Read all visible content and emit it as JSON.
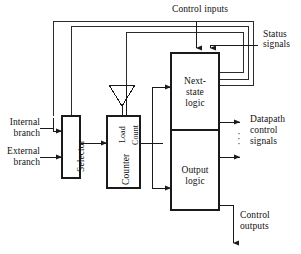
{
  "diagram": {
    "blocks": [
      {
        "id": "selector",
        "label": "Selector",
        "orientation": "vertical"
      },
      {
        "id": "counter",
        "label": "Counter",
        "orientation": "vertical"
      },
      {
        "id": "next_state",
        "label_line1": "Next-",
        "label_line2": "state",
        "label_line3": "logic"
      },
      {
        "id": "output",
        "label_line1": "Output",
        "label_line2": "logic"
      }
    ],
    "counter_pins": {
      "load": "Load",
      "count": "Count"
    },
    "labels": {
      "control_inputs": "Control inputs",
      "status_signals_line1": "Status",
      "status_signals_line2": "signals",
      "internal_branch_line1": "Internal",
      "internal_branch_line2": "branch",
      "external_branch_line1": "External",
      "external_branch_line2": "branch",
      "datapath_line1": "Datapath",
      "datapath_line2": "control",
      "datapath_line3": "signals",
      "control_outputs_line1": "Control",
      "control_outputs_line2": "outputs",
      "ellipsis": "·\n·\n·"
    },
    "colors": {
      "stroke": "#1a1a1a",
      "line": "#2b2b2b",
      "text": "#101010",
      "background": "#ffffff"
    }
  }
}
